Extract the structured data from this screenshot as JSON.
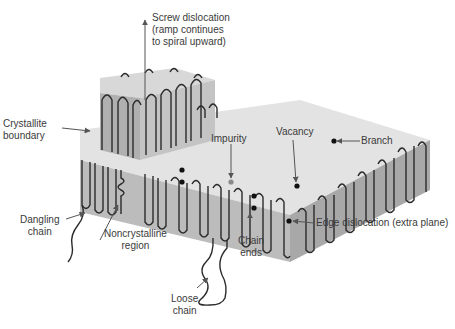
{
  "diagram": {
    "type": "schematic",
    "colors": {
      "top_face": "#e3e3e3",
      "front_face": "#bcbcbc",
      "side_face": "#a8a8a8",
      "chain": "#2b2b2b",
      "impurity": "#8a8a8a",
      "defect_dot": "#111111",
      "label_text": "#3a3a3a",
      "leader": "#555555"
    },
    "labels": {
      "screw": "Screw dislocation\n(ramp continues\nto spiral upward)",
      "boundary": "Crystallite\nboundary",
      "dangling": "Dangling\nchain",
      "noncrystalline": "Noncrystalline\nregion",
      "loose": "Loose\nchain",
      "chain_ends": "Chain\nends",
      "impurity": "Impurity",
      "vacancy": "Vacancy",
      "branch": "Branch",
      "edge": "Edge dislocation (extra plane)"
    }
  }
}
